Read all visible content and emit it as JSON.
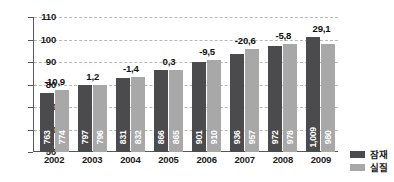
{
  "chart_data": {
    "type": "bar",
    "title": "",
    "xlabel": "",
    "ylabel": "",
    "categories": [
      "2002",
      "2003",
      "2004",
      "2005",
      "2006",
      "2007",
      "2008",
      "2009"
    ],
    "ylim": [
      50,
      110
    ],
    "yticks": [
      50,
      60,
      70,
      80,
      90,
      100,
      110
    ],
    "ytick_labels": [
      "50",
      "60",
      "70",
      "80",
      "90",
      "100",
      "110"
    ],
    "grid": true,
    "legend_position": "bottom-right",
    "value_scale_note": "bar labels are in units of 1/10 of the axis value",
    "series": [
      {
        "name": "잠재",
        "color": "#4b4b4d",
        "values": [
          76.3,
          79.7,
          83.1,
          86.6,
          90.1,
          93.6,
          97.2,
          100.9
        ],
        "labels": [
          "763",
          "797",
          "831",
          "866",
          "901",
          "936",
          "972",
          "1,009"
        ]
      },
      {
        "name": "실질",
        "color": "#a8a8a8",
        "values": [
          77.4,
          79.6,
          83.2,
          86.5,
          91.0,
          95.7,
          97.8,
          98.0
        ],
        "labels": [
          "774",
          "796",
          "832",
          "865",
          "910",
          "957",
          "978",
          "980"
        ]
      }
    ],
    "gap_labels": [
      "-10,9",
      "1,2",
      "-1,4",
      "0,3",
      "-9,5",
      "-20,6",
      "-5,8",
      "29,1"
    ],
    "legend": [
      {
        "label": "잠재",
        "color": "#4b4b4d"
      },
      {
        "label": "실질",
        "color": "#a8a8a8"
      }
    ],
    "colors": {
      "potential": "#4b4b4d",
      "actual": "#a8a8a8",
      "axis": "#58585a",
      "grid": "#b8b8b8",
      "text": "#1b1b1b",
      "background": "#ffffff"
    }
  }
}
